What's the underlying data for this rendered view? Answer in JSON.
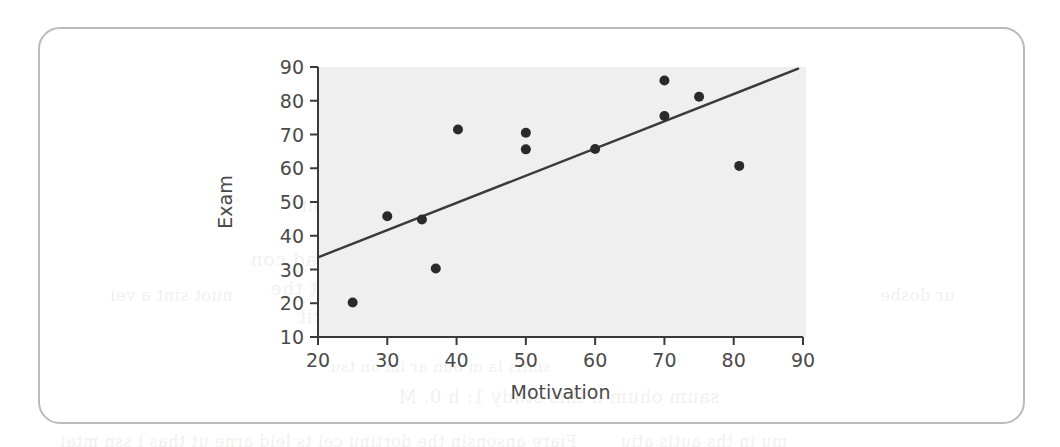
{
  "figure": {
    "frame_color": "#b9babc",
    "panel_color": "#efefef",
    "ink_color": "#3a3a3a"
  },
  "ghost_text": [
    {
      "x": 300,
      "y": 196,
      "size": 17,
      "text": "a pu ta dt ui tarus ad samoit"
    },
    {
      "x": 250,
      "y": 248,
      "size": 19,
      "text": "in Tarj yun 3334 fe nosi had con"
    },
    {
      "x": 468,
      "y": 248,
      "size": 19,
      "text": "for  tis nuomtuls"
    },
    {
      "x": 270,
      "y": 277,
      "size": 19,
      "text": "o in that case. Hence, however we interpret the"
    },
    {
      "x": 298,
      "y": 305,
      "size": 19,
      "text": "tams thes the the tebsen tchmasion this acit"
    },
    {
      "x": 110,
      "y": 286,
      "size": 16,
      "text": "nuot sint a vei"
    },
    {
      "x": 880,
      "y": 286,
      "size": 16,
      "text": "ur dosbe"
    },
    {
      "x": 330,
      "y": 358,
      "size": 15,
      "text": "smtis la  m  oun ar  im on tsu"
    },
    {
      "x": 398,
      "y": 386,
      "size": 18,
      "text": "saum ohum u   this study 1: h 0. M"
    },
    {
      "x": 60,
      "y": 432,
      "size": 16,
      "text": "Fiare ansonsin the dortinu  cei ts leid arne ut thas i ssn mtai"
    },
    {
      "x": 620,
      "y": 432,
      "size": 16,
      "text": "mu in ths autis atiu"
    }
  ],
  "chart_data": {
    "type": "scatter",
    "title": "",
    "xlabel": "Motivation",
    "ylabel": "Exam",
    "xlim": [
      20,
      90
    ],
    "ylim": [
      10,
      90
    ],
    "xticks": [
      20,
      30,
      40,
      50,
      60,
      70,
      80,
      90
    ],
    "yticks": [
      10,
      20,
      30,
      40,
      50,
      60,
      70,
      80,
      90
    ],
    "grid": false,
    "legend": false,
    "marker_color": "#2a2a2a",
    "marker_radius": 5,
    "points": [
      {
        "x": 25.0,
        "y": 20.2
      },
      {
        "x": 30.0,
        "y": 45.8
      },
      {
        "x": 35.0,
        "y": 44.8
      },
      {
        "x": 37.0,
        "y": 30.3
      },
      {
        "x": 40.2,
        "y": 71.5
      },
      {
        "x": 50.0,
        "y": 70.5
      },
      {
        "x": 50.0,
        "y": 65.6
      },
      {
        "x": 60.0,
        "y": 65.7
      },
      {
        "x": 70.0,
        "y": 86.0
      },
      {
        "x": 70.0,
        "y": 75.5
      },
      {
        "x": 75.0,
        "y": 81.2
      },
      {
        "x": 80.8,
        "y": 60.7
      }
    ],
    "fit_line": {
      "color": "#3a3a3a",
      "width": 2.4,
      "x_start": 20.0,
      "y_start": 33.6,
      "x_end": 89.3,
      "y_end": 89.5
    }
  }
}
